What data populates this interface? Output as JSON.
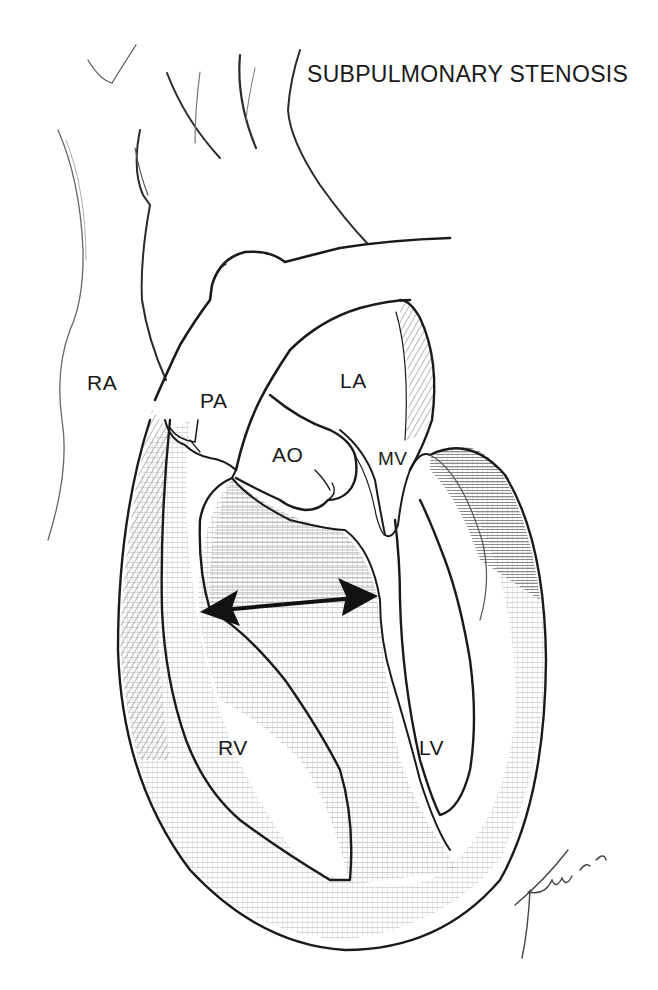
{
  "figure": {
    "title": "SUBPULMONARY STENOSIS",
    "type": "anatomical line illustration",
    "colors": {
      "background": "#ffffff",
      "ink": "#1a1a1a",
      "shading": "#8a8a8a"
    },
    "labels": {
      "ra": "RA",
      "pa": "PA",
      "la": "LA",
      "ao": "AO",
      "mv": "MV",
      "rv": "RV",
      "lv": "LV"
    },
    "annotations": {
      "arrow": "double-headed arrow across right ventricular outflow (subpulmonary region)",
      "signature": "artist signature, lower right"
    }
  }
}
